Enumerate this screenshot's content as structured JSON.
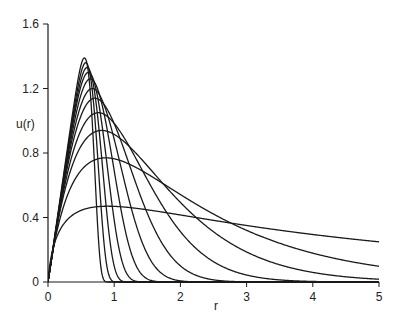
{
  "chart_data": {
    "type": "line",
    "title": "",
    "xlabel": "r",
    "ylabel": "u(r)",
    "xlim": [
      0,
      5
    ],
    "ylim": [
      0,
      1.6
    ],
    "xticks": [
      0,
      1,
      2,
      3,
      4,
      5
    ],
    "yticks": [
      0,
      0.4,
      0.8,
      1.2,
      1.6
    ],
    "xtick_labels": [
      "0",
      "1",
      "2",
      "3",
      "4",
      "5"
    ],
    "ytick_labels": [
      "0",
      "0.4",
      "0.8",
      "1.2",
      "1.6"
    ],
    "grid": false,
    "legend": null,
    "line_color": "#1a1a1a",
    "series": [
      {
        "name": "curve-1",
        "peak_r": 0.55,
        "peak_u": 1.39,
        "shape_k": 9.0
      },
      {
        "name": "curve-2",
        "peak_r": 0.57,
        "peak_u": 1.36,
        "shape_k": 7.0
      },
      {
        "name": "curve-3",
        "peak_r": 0.59,
        "peak_u": 1.33,
        "shape_k": 5.5
      },
      {
        "name": "curve-4",
        "peak_r": 0.61,
        "peak_u": 1.3,
        "shape_k": 4.3
      },
      {
        "name": "curve-5",
        "peak_r": 0.64,
        "peak_u": 1.26,
        "shape_k": 3.4
      },
      {
        "name": "curve-6",
        "peak_r": 0.67,
        "peak_u": 1.2,
        "shape_k": 2.6
      },
      {
        "name": "curve-7",
        "peak_r": 0.71,
        "peak_u": 1.14,
        "shape_k": 2.0
      },
      {
        "name": "curve-8",
        "peak_r": 0.76,
        "peak_u": 1.05,
        "shape_k": 1.5
      },
      {
        "name": "curve-9",
        "peak_r": 0.81,
        "peak_u": 0.94,
        "shape_k": 1.1
      },
      {
        "name": "curve-10",
        "peak_r": 0.87,
        "peak_u": 0.77,
        "shape_k": 0.8
      },
      {
        "name": "curve-11",
        "peak_r": 0.9,
        "peak_u": 0.47,
        "shape_k": 0.35
      }
    ]
  }
}
